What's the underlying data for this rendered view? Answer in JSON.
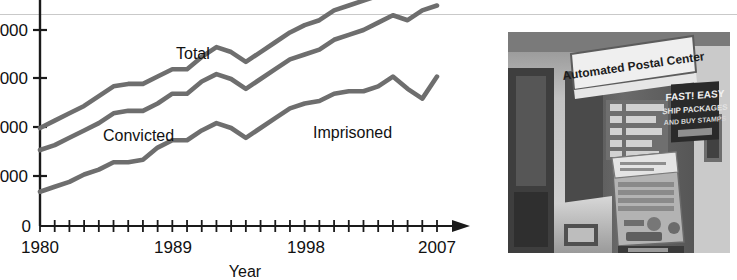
{
  "figure": {
    "background_color": "#ffffff",
    "rule_color": "#c9c9c9"
  },
  "chart_data": {
    "type": "line",
    "title": "",
    "xlabel": "Year",
    "ylabel": "",
    "line_color": "#6e6e6e",
    "axis_color": "#1a1a1a",
    "grid": false,
    "legend_position": "inline-labels",
    "xlim": [
      1980,
      2007
    ],
    "xtick_labels": [
      "1980",
      "1989",
      "1998",
      "2007"
    ],
    "xtick_label_years": [
      1980,
      1989,
      1998,
      2007
    ],
    "x_minor_tick_years": [
      1980,
      1981,
      1982,
      1983,
      1984,
      1985,
      1986,
      1987,
      1988,
      1989,
      1990,
      1991,
      1992,
      1993,
      1994,
      1995,
      1996,
      1997,
      1998,
      1999,
      2000,
      2001,
      2002,
      2003,
      2004,
      2005,
      2006,
      2007
    ],
    "ytick_labels": [
      "000",
      "000",
      "000",
      "000",
      "0"
    ],
    "ytick_labels_note": "leading digits cropped off the left edge of the image",
    "ylim": [
      0,
      100
    ],
    "ytick_values": [
      80,
      60,
      40,
      20,
      0
    ],
    "x": [
      1980,
      1981,
      1982,
      1983,
      1984,
      1985,
      1986,
      1987,
      1988,
      1989,
      1990,
      1991,
      1992,
      1993,
      1994,
      1995,
      1996,
      1997,
      1998,
      1999,
      2000,
      2001,
      2002,
      2003,
      2004,
      2005,
      2006,
      2007
    ],
    "series": [
      {
        "name": "Total",
        "label": "Total",
        "values": [
          40,
          43,
          46,
          49,
          53,
          57,
          58,
          58,
          61,
          64,
          64,
          69,
          73,
          71,
          67,
          71,
          75,
          79,
          82,
          84,
          88,
          90,
          92,
          94,
          98,
          95,
          99,
          101
        ]
      },
      {
        "name": "Convicted",
        "label": "Convicted",
        "values": [
          31,
          33,
          36,
          39,
          42,
          46,
          47,
          47,
          50,
          54,
          54,
          59,
          62,
          60,
          56,
          60,
          64,
          68,
          70,
          72,
          76,
          78,
          80,
          83,
          86,
          84,
          88,
          90
        ]
      },
      {
        "name": "Imprisoned",
        "label": "Imprisoned",
        "values": [
          14,
          16,
          18,
          21,
          23,
          26,
          26,
          27,
          32,
          35,
          35,
          39,
          42,
          40,
          36,
          40,
          44,
          48,
          50,
          51,
          54,
          55,
          55,
          57,
          61,
          56,
          52,
          61
        ]
      }
    ],
    "annotations": [
      {
        "text": "Total",
        "series": "Total"
      },
      {
        "text": "Convicted",
        "series": "Convicted"
      },
      {
        "text": "Imprisoned",
        "series": "Imprisoned"
      }
    ]
  },
  "photo": {
    "alt_name": "automated-postal-center-kiosk-photo",
    "kiosk_sign_text": "Automated Postal Center",
    "poster_lines": [
      "FAST! EASY",
      "SHIP PACKAGES",
      "AND BUY STAMPS"
    ],
    "style": "black-and-white photograph"
  }
}
